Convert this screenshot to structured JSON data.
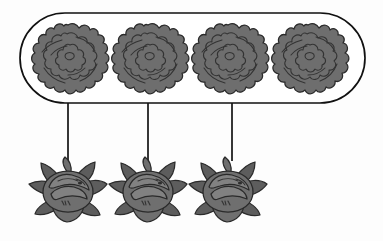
{
  "canvas": {
    "width": 383,
    "height": 241,
    "background_color": "#fdfdfd",
    "title": "Flower grouping diagram"
  },
  "palette": {
    "outline": "#2a2a2a",
    "container_stroke": "#111111",
    "container_fill": "#ffffff",
    "connector": "#141414",
    "flower_mid": "#6e6e6e",
    "flower_dark": "#5d5d5d",
    "flower_light": "#818181"
  },
  "group_container": {
    "name": "top-group-container",
    "shape": "rounded-rectangle",
    "x": 20,
    "y": 13,
    "width": 345,
    "height": 90,
    "corner_radius": 45,
    "stroke_width": 1.7,
    "member_count": 4
  },
  "top_row": {
    "label": "ruffled rosette flowers",
    "icon_name": "ruffled-rosette-flower-icon",
    "count": 4,
    "center_y": 58,
    "diameter": 66,
    "items": [
      {
        "id": "rosette-1",
        "cx": 68,
        "cy": 58
      },
      {
        "id": "rosette-2",
        "cx": 148,
        "cy": 58
      },
      {
        "id": "rosette-3",
        "cx": 228,
        "cy": 58
      },
      {
        "id": "rosette-4",
        "cx": 308,
        "cy": 58
      }
    ]
  },
  "connectors": {
    "label": "vertical connector lines",
    "count": 3,
    "y_start": 103,
    "y_end": 161,
    "items": [
      {
        "id": "connector-1",
        "x": 68
      },
      {
        "id": "connector-2",
        "x": 148
      },
      {
        "id": "connector-3",
        "x": 232
      }
    ]
  },
  "bottom_row": {
    "label": "lotus water-lily flowers",
    "icon_name": "lotus-flower-icon",
    "count": 3,
    "center_y": 190,
    "width": 78,
    "items": [
      {
        "id": "lotus-1",
        "cx": 68,
        "cy": 190
      },
      {
        "id": "lotus-2",
        "cx": 148,
        "cy": 190
      },
      {
        "id": "lotus-3",
        "cx": 228,
        "cy": 190
      }
    ]
  }
}
